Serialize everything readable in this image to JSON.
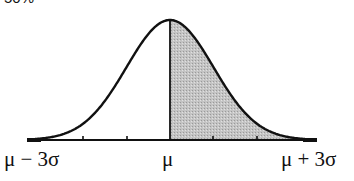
{
  "figure": {
    "top_label": "50%",
    "distribution": "normal",
    "shaded_region": "mean to +3 sigma (right half)",
    "colors": {
      "curve": "#111111",
      "shade": "#bdbdbd",
      "background": "#ffffff"
    },
    "axis": {
      "labels": {
        "left": "μ − 3σ",
        "center": "μ",
        "right": "μ + 3σ"
      },
      "tick_count_each_side": 2
    }
  }
}
